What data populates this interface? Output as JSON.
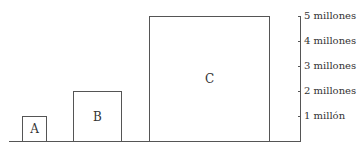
{
  "diagram": {
    "boxes": [
      {
        "label": "A",
        "value": 1000000
      },
      {
        "label": "B",
        "value": 2000000
      },
      {
        "label": "C",
        "value": 5000000
      }
    ],
    "axis": {
      "ticks": [
        "1 millón",
        "2 millones",
        "3 millones",
        "4 millones",
        "5 millones"
      ]
    }
  },
  "colors": {
    "line": "#555555",
    "text": "#333333",
    "background": "#ffffff"
  }
}
